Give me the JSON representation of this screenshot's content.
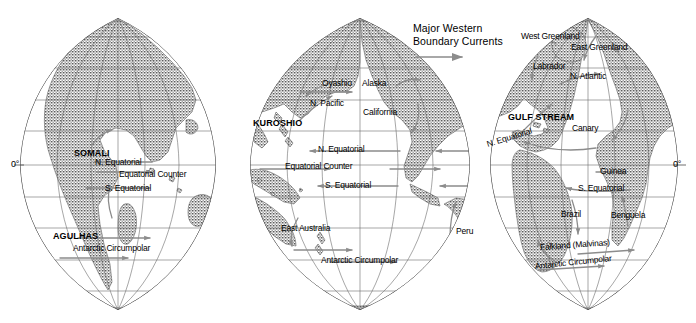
{
  "map": {
    "title": "Major Ocean Surface Currents",
    "projection": "interrupted-sinusoidal-three-lobe",
    "axis_labels": {
      "left_equator": "0°",
      "right_equator": "0°"
    },
    "colors": {
      "land_fill": "#8a8a8a",
      "ocean_fill": "#ffffff",
      "graticule": "#6b6b6b",
      "outline": "#4a4a4a",
      "arrow": "#8c8c8c",
      "text": "#000000"
    }
  },
  "legend": {
    "line1": "Major Western",
    "line2": "Boundary Currents",
    "arrow_icon": "right-arrow-icon"
  },
  "labels": [
    {
      "id": "somali",
      "text": "SOMALI",
      "style": "major",
      "x": 74,
      "y": 149,
      "lobe": "indian"
    },
    {
      "id": "agulhas",
      "text": "AGULHAS",
      "style": "major",
      "x": 53,
      "y": 232,
      "lobe": "indian"
    },
    {
      "id": "ind-n-equatorial",
      "text": "N. Equatorial",
      "style": "current",
      "x": 95,
      "y": 158,
      "lobe": "indian"
    },
    {
      "id": "ind-equatorial-ctr",
      "text": "Equatorial Counter",
      "style": "current",
      "x": 119,
      "y": 170,
      "lobe": "indian"
    },
    {
      "id": "ind-s-equatorial",
      "text": "S. Equatorial",
      "style": "current",
      "x": 105,
      "y": 184,
      "lobe": "indian"
    },
    {
      "id": "ind-antarctic",
      "text": "Antarctic Circumpolar",
      "style": "current",
      "x": 73,
      "y": 244,
      "lobe": "indian"
    },
    {
      "id": "kuroshio",
      "text": "KUROSHIO",
      "style": "major",
      "x": 253,
      "y": 119,
      "lobe": "pacific"
    },
    {
      "id": "oyashio",
      "text": "Oyashio",
      "style": "current",
      "x": 322,
      "y": 79,
      "lobe": "pacific"
    },
    {
      "id": "alaska",
      "text": "Alaska",
      "style": "current",
      "x": 362,
      "y": 79,
      "lobe": "pacific"
    },
    {
      "id": "n-pacific",
      "text": "N. Pacific",
      "style": "current",
      "x": 310,
      "y": 99,
      "lobe": "pacific"
    },
    {
      "id": "california",
      "text": "California",
      "style": "current",
      "x": 363,
      "y": 108,
      "lobe": "pacific"
    },
    {
      "id": "pac-n-equatorial",
      "text": "N. Equatorial",
      "style": "current",
      "x": 318,
      "y": 145,
      "lobe": "pacific"
    },
    {
      "id": "pac-equatorial-ctr",
      "text": "Equatorial Counter",
      "style": "current",
      "x": 285,
      "y": 162,
      "lobe": "pacific"
    },
    {
      "id": "pac-s-equatorial",
      "text": "S. Equatorial",
      "style": "current",
      "x": 325,
      "y": 181,
      "lobe": "pacific"
    },
    {
      "id": "east-australia",
      "text": "East Australia",
      "style": "current",
      "x": 281,
      "y": 224,
      "lobe": "pacific"
    },
    {
      "id": "peru",
      "text": "Peru",
      "style": "current",
      "x": 456,
      "y": 227,
      "lobe": "pacific"
    },
    {
      "id": "pac-antarctic",
      "text": "Antarctic Circumpolar",
      "style": "current",
      "x": 321,
      "y": 256,
      "lobe": "pacific"
    },
    {
      "id": "west-greenland",
      "text": "West Greenland",
      "style": "current",
      "x": 521,
      "y": 32,
      "lobe": "atlantic"
    },
    {
      "id": "east-greenland",
      "text": "East Greenland",
      "style": "current",
      "x": 571,
      "y": 43,
      "lobe": "atlantic"
    },
    {
      "id": "labrador",
      "text": "Labrador",
      "style": "current",
      "x": 533,
      "y": 62,
      "lobe": "atlantic"
    },
    {
      "id": "n-atlantic",
      "text": "N. Atlantic",
      "style": "current",
      "x": 570,
      "y": 72,
      "lobe": "atlantic"
    },
    {
      "id": "gulf-stream",
      "text": "GULF STREAM",
      "style": "major",
      "x": 508,
      "y": 113,
      "lobe": "atlantic"
    },
    {
      "id": "canary",
      "text": "Canary",
      "style": "current",
      "x": 572,
      "y": 124,
      "lobe": "atlantic"
    },
    {
      "id": "atl-n-equatorial",
      "text": "N. Equatorial",
      "style": "current",
      "x": 487,
      "y": 140,
      "lobe": "atlantic",
      "rotate": "nequ"
    },
    {
      "id": "guinea",
      "text": "Guinea",
      "style": "current",
      "x": 600,
      "y": 167,
      "lobe": "atlantic"
    },
    {
      "id": "atl-s-equatorial",
      "text": "S. Equatorial",
      "style": "current",
      "x": 578,
      "y": 184,
      "lobe": "atlantic"
    },
    {
      "id": "brazil",
      "text": "Brazil",
      "style": "current",
      "x": 561,
      "y": 210,
      "lobe": "atlantic"
    },
    {
      "id": "benguela",
      "text": "Benguela",
      "style": "current",
      "x": 611,
      "y": 211,
      "lobe": "atlantic"
    },
    {
      "id": "falkland",
      "text": "Falkland (Malvinas)",
      "style": "current",
      "x": 540,
      "y": 243,
      "lobe": "atlantic",
      "rotate": "falk"
    },
    {
      "id": "atl-antarctic",
      "text": "Antarctic Circumpolar",
      "style": "current",
      "x": 535,
      "y": 262,
      "lobe": "atlantic",
      "rotate": "antarc-r"
    }
  ]
}
